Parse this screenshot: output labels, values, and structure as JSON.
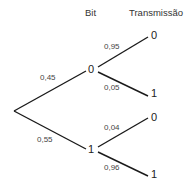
{
  "headers": {
    "bit": "Bit",
    "transmission": "Transmissão"
  },
  "tree": {
    "root": {},
    "branches": [
      {
        "prob": "0,45",
        "node": "0",
        "children": [
          {
            "prob": "0,95",
            "leaf": "0"
          },
          {
            "prob": "0,05",
            "leaf": "1"
          }
        ]
      },
      {
        "prob": "0,55",
        "node": "1",
        "children": [
          {
            "prob": "0,04",
            "leaf": "0"
          },
          {
            "prob": "0,96",
            "leaf": "1"
          }
        ]
      }
    ]
  }
}
